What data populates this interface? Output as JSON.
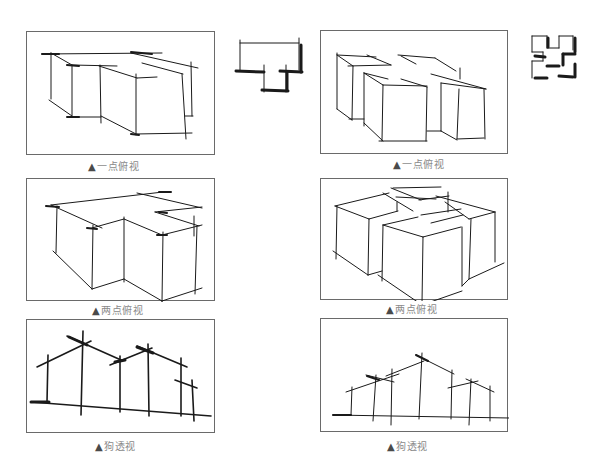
{
  "figures": [
    {
      "id": "fig-1",
      "caption": "一点俯视",
      "marker": "▲",
      "type": "one-point-aerial",
      "position": "row1-left"
    },
    {
      "id": "fig-2",
      "caption": "一点俯视",
      "marker": "▲",
      "type": "one-point-aerial",
      "position": "row1-right"
    },
    {
      "id": "fig-3",
      "caption": "两点俯视",
      "marker": "▲",
      "type": "two-point-aerial",
      "position": "row2-left"
    },
    {
      "id": "fig-4",
      "caption": "两点俯视",
      "marker": "▲",
      "type": "two-point-aerial",
      "position": "row2-right"
    },
    {
      "id": "fig-5",
      "caption": "狗透视",
      "marker": "▲",
      "type": "dog-eye-perspective",
      "position": "row3-left"
    },
    {
      "id": "fig-6",
      "caption": "狗透视",
      "marker": "▲",
      "type": "dog-eye-perspective",
      "position": "row3-right"
    }
  ],
  "plans": [
    {
      "id": "plan-1",
      "shape": "L-shaped-plan-sketch",
      "position": "row1-left-side"
    },
    {
      "id": "plan-2",
      "shape": "cross-shaped-plan-sketch",
      "position": "row1-right-side"
    }
  ],
  "colors": {
    "ink": "#1a1a1a",
    "frame": "#6a6a6a",
    "caption": "#8a8a8a"
  }
}
